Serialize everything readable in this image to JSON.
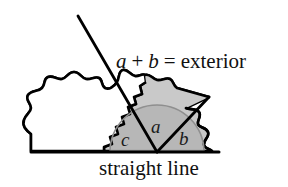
{
  "figure": {
    "title_text": "a + b = exterior",
    "equation": {
      "term_a": "a",
      "plus": "+",
      "term_b": "b",
      "equals": "=",
      "result": "exterior"
    },
    "caption": "straight line",
    "angle_labels": {
      "interior": "c",
      "adjacent_left": "a",
      "adjacent_right": "b"
    },
    "colors": {
      "outline": "#000000",
      "blob_light_gray": "#c9c9c9",
      "blob_mid_gray": "#b4b4b4",
      "arc_stroke": "#8a8a8a",
      "background": "#ffffff",
      "text": "#111111"
    },
    "geometry": {
      "vertex_x": 157,
      "vertex_y": 152,
      "baseline_y": 152,
      "baseline_x_start": 31,
      "baseline_x_end": 219,
      "arc_radius": 47,
      "ray_up_left_end_x": 78,
      "ray_up_left_end_y": 16,
      "ray_up_right_end_x": 209,
      "ray_up_right_end_y": 97
    }
  }
}
